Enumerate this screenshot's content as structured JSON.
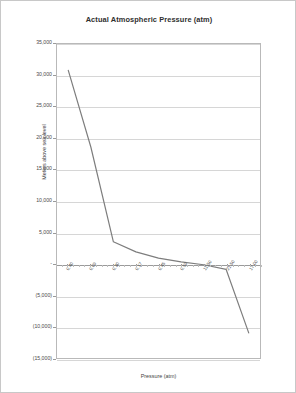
{
  "chart_data": {
    "type": "line",
    "title": "Actual Atmospheric Pressure (atm)",
    "xlabel": "Pressure (atm)",
    "ylabel": "Meters above sea level",
    "ylim": [
      -15000,
      35000
    ],
    "ytick_values": [
      35000,
      30000,
      25000,
      20000,
      15000,
      10000,
      5000,
      0,
      -5000,
      -10000,
      -15000
    ],
    "ytick_labels": [
      "35,000",
      "30,000",
      "25,000",
      "20,000",
      "15,000",
      "10,000",
      "5,000",
      "-",
      "(5,000)",
      "(10,000)",
      "(15,000)"
    ],
    "xtick_labels": [
      "0.40",
      "0.09",
      "0.30",
      "0.17",
      "0.45",
      "0.59",
      "11.50",
      "21.50",
      "17.00"
    ],
    "grid": true,
    "legend": "none",
    "series": [
      {
        "name": "Altitude vs Pressure",
        "x": [
          "0.40",
          "0.09",
          "0.30",
          "0.17",
          "0.45",
          "0.59",
          "11.50",
          "21.50",
          "17.00"
        ],
        "values": [
          30800,
          18600,
          3500,
          1900,
          900,
          300,
          -150,
          -900,
          -11000
        ]
      }
    ]
  },
  "page": {
    "title": "Actual Atmospheric Pressure (atm)"
  }
}
